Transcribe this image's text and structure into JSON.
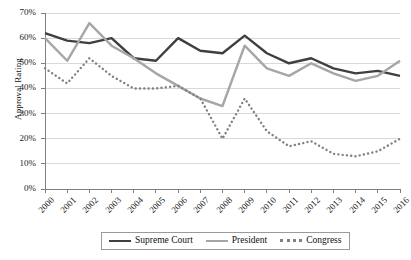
{
  "chart_data": {
    "type": "line",
    "title": "",
    "xlabel": "",
    "ylabel": "Approval Rating",
    "x": [
      2000,
      2001,
      2002,
      2003,
      2004,
      2005,
      2006,
      2007,
      2008,
      2009,
      2010,
      2011,
      2012,
      2013,
      2014,
      2015,
      2016
    ],
    "categories": [
      "2000",
      "2001",
      "2002",
      "2003",
      "2004",
      "2005",
      "2006",
      "2007",
      "2008",
      "2009",
      "2010",
      "2011",
      "2012",
      "2013",
      "2014",
      "2015",
      "2016"
    ],
    "ylim": [
      0,
      70
    ],
    "yticks": [
      0,
      10,
      20,
      30,
      40,
      50,
      60,
      70
    ],
    "ytick_labels": [
      "0%",
      "10%",
      "20%",
      "30%",
      "40%",
      "50%",
      "60%",
      "70%"
    ],
    "grid": true,
    "legend_position": "bottom",
    "series": [
      {
        "name": "Supreme Court",
        "color": "#3f3f3f",
        "dash": "solid",
        "values": [
          62,
          59,
          58,
          60,
          52,
          51,
          60,
          55,
          54,
          61,
          54,
          50,
          52,
          48,
          46,
          47,
          45
        ]
      },
      {
        "name": "President",
        "color": "#a6a6a6",
        "dash": "solid",
        "values": [
          60,
          51,
          66,
          57,
          52,
          46,
          41,
          36,
          33,
          57,
          48,
          45,
          50,
          46,
          43,
          45,
          51
        ]
      },
      {
        "name": "Congress",
        "color": "#808080",
        "dash": "dotted",
        "values": [
          48,
          42,
          52,
          45,
          40,
          40,
          41,
          36,
          20,
          36,
          23,
          17,
          19,
          14,
          13,
          15,
          20
        ]
      }
    ]
  },
  "axis": {
    "y_title": "Approval Rating"
  },
  "legend": {
    "items": [
      {
        "label": "Supreme Court"
      },
      {
        "label": "President"
      },
      {
        "label": "Congress"
      }
    ]
  }
}
